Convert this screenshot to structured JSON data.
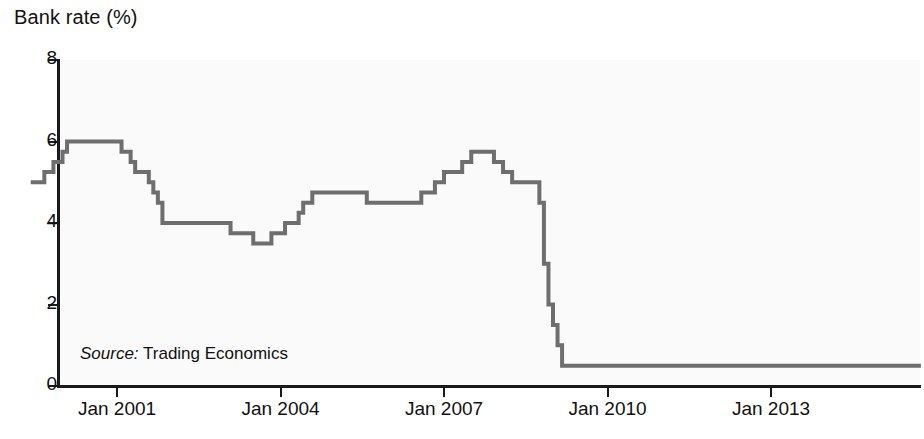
{
  "chart_data": {
    "type": "line",
    "title": "Bank rate (%)",
    "xlabel": "",
    "ylabel": "Bank rate (%)",
    "ylim": [
      0,
      8
    ],
    "yticks": [
      0,
      2,
      4,
      6,
      8
    ],
    "ytick_labels": [
      "0",
      "2",
      "4",
      "6",
      "8"
    ],
    "xlim": [
      "1999-06",
      "2015-10"
    ],
    "xticks": [
      "Jan 2001",
      "Jan 2004",
      "Jan 2007",
      "Jan 2010",
      "Jan 2013"
    ],
    "xtick_years": [
      2001,
      2004,
      2007,
      2010,
      2013
    ],
    "grid": false,
    "legend": null,
    "drawstyle": "steps-post",
    "line_color": "#6e6e6e",
    "line_width": 4,
    "background": "#fafafa",
    "annotations": [
      {
        "name": "source",
        "label": "Source:",
        "text": "Trading Economics"
      }
    ],
    "series": [
      {
        "name": "Bank rate",
        "units": "%",
        "x": [
          "1999-06",
          "1999-09",
          "1999-11",
          "2000-01",
          "2000-02",
          "2001-02",
          "2001-04",
          "2001-05",
          "2001-08",
          "2001-09",
          "2001-10",
          "2001-11",
          "2003-02",
          "2003-07",
          "2003-11",
          "2004-02",
          "2004-05",
          "2004-06",
          "2004-08",
          "2005-08",
          "2006-08",
          "2006-11",
          "2007-01",
          "2007-05",
          "2007-07",
          "2007-12",
          "2008-02",
          "2008-04",
          "2008-10",
          "2008-11",
          "2008-12",
          "2009-01",
          "2009-02",
          "2009-03",
          "2015-10"
        ],
        "y": [
          5.0,
          5.25,
          5.5,
          5.75,
          6.0,
          5.75,
          5.5,
          5.25,
          5.0,
          4.75,
          4.5,
          4.0,
          3.75,
          3.5,
          3.75,
          4.0,
          4.25,
          4.5,
          4.75,
          4.5,
          4.75,
          5.0,
          5.25,
          5.5,
          5.75,
          5.5,
          5.25,
          5.0,
          4.5,
          3.0,
          2.0,
          1.5,
          1.0,
          0.5,
          0.5
        ]
      }
    ]
  }
}
